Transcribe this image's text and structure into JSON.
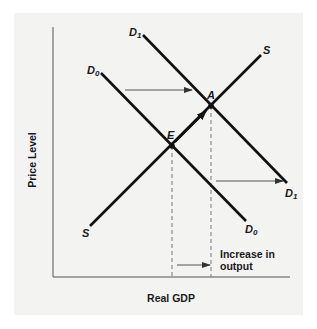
{
  "diagram": {
    "type": "aggregate-demand-supply-shift",
    "axes": {
      "x_label": "Real GDP",
      "y_label": "Price Level"
    },
    "curves": {
      "d0": {
        "label": "D",
        "subscript": "0",
        "description": "Initial demand curve"
      },
      "d1": {
        "label": "D",
        "subscript": "1",
        "description": "Shifted demand curve (rightward)"
      },
      "s": {
        "label": "S",
        "description": "Supply curve"
      }
    },
    "points": {
      "e": {
        "label": "E",
        "description": "Initial equilibrium"
      },
      "a": {
        "label": "A",
        "description": "New equilibrium"
      }
    },
    "annotations": {
      "output_increase": "Increase in",
      "output_increase_line2": "output"
    },
    "colors": {
      "panel_bg": "#f3f3f2",
      "line": "#111111",
      "axis": "#555555",
      "arrow": "#555555",
      "dashed": "#777777"
    }
  }
}
